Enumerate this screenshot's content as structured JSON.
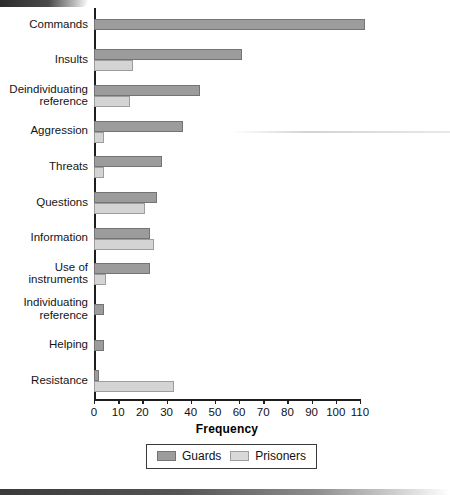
{
  "chart_data": {
    "type": "bar",
    "orientation": "horizontal",
    "title": "",
    "xlabel": "Frequency",
    "ylabel": "",
    "xlim": [
      0,
      110
    ],
    "xticks": [
      0,
      10,
      20,
      30,
      40,
      50,
      60,
      70,
      80,
      90,
      100,
      110
    ],
    "grid": false,
    "legend_position": "bottom-center",
    "categories": [
      "Commands",
      "Insults",
      "Deindividuating\nreference",
      "Aggression",
      "Threats",
      "Questions",
      "Information",
      "Use of\ninstruments",
      "Individuating\nreference",
      "Helping",
      "Resistance"
    ],
    "series": [
      {
        "name": "Guards",
        "color": "#9c9c9c",
        "values": [
          112,
          61,
          44,
          37,
          28,
          26,
          23,
          23,
          4,
          4,
          2
        ]
      },
      {
        "name": "Prisoners",
        "color": "#d4d4d4",
        "values": [
          0,
          16,
          15,
          4,
          4,
          21,
          25,
          5,
          0,
          0,
          33
        ]
      }
    ]
  },
  "axis": {
    "x_label": "Frequency",
    "tick_labels": [
      "0",
      "10",
      "20",
      "30",
      "40",
      "50",
      "60",
      "70",
      "80",
      "90",
      "100",
      "110"
    ]
  },
  "legend": {
    "items": [
      {
        "label": "Guards",
        "swatch": "guards-swatch"
      },
      {
        "label": "Prisoners",
        "swatch": "prisoners-swatch"
      }
    ]
  }
}
